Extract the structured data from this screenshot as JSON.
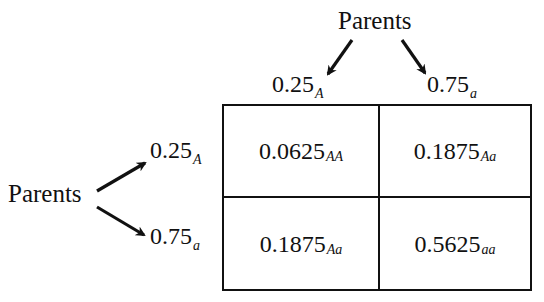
{
  "diagram": {
    "top_parent": {
      "label": "Parents",
      "alleles": [
        {
          "value": "0.25",
          "allele": "A"
        },
        {
          "value": "0.75",
          "allele": "a"
        }
      ]
    },
    "left_parent": {
      "label": "Parents",
      "alleles": [
        {
          "value": "0.25",
          "allele": "A"
        },
        {
          "value": "0.75",
          "allele": "a"
        }
      ]
    },
    "cells": [
      [
        {
          "value": "0.0625",
          "genotype": "AA"
        },
        {
          "value": "0.1875",
          "genotype": "Aa"
        }
      ],
      [
        {
          "value": "0.1875",
          "genotype": "Aa"
        },
        {
          "value": "0.5625",
          "genotype": "aa"
        }
      ]
    ],
    "colors": {
      "ink": "#111111",
      "background": "#ffffff"
    }
  }
}
